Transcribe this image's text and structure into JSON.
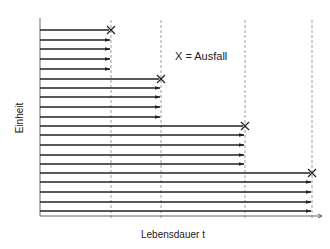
{
  "diagram": {
    "title": "",
    "legend": {
      "text": "X = Ausfall",
      "x": 175,
      "y": 60
    },
    "axes": {
      "x_label": "Lebensdauer t",
      "y_label": "Einheit",
      "origin": [
        40,
        216
      ],
      "x_end": 322,
      "y_top": 18
    },
    "colors": {
      "line": "#222222",
      "axis": "#666666",
      "dashed": "#888888",
      "text": "#222222"
    },
    "failure_times_px": [
      111,
      161,
      245,
      312
    ],
    "groups": [
      {
        "failure_x": 111,
        "rows": [
          {
            "y": 30,
            "failed": true
          },
          {
            "y": 40,
            "failed": false
          },
          {
            "y": 49,
            "failed": false
          },
          {
            "y": 59,
            "failed": false
          },
          {
            "y": 69,
            "failed": false
          }
        ]
      },
      {
        "failure_x": 161,
        "rows": [
          {
            "y": 79,
            "failed": true
          },
          {
            "y": 88,
            "failed": false
          },
          {
            "y": 97,
            "failed": false
          },
          {
            "y": 107,
            "failed": false
          },
          {
            "y": 117,
            "failed": false
          }
        ]
      },
      {
        "failure_x": 245,
        "rows": [
          {
            "y": 126,
            "failed": true
          },
          {
            "y": 135,
            "failed": false
          },
          {
            "y": 145,
            "failed": false
          },
          {
            "y": 155,
            "failed": false
          },
          {
            "y": 164,
            "failed": false
          }
        ]
      },
      {
        "failure_x": 312,
        "rows": [
          {
            "y": 173,
            "failed": true
          },
          {
            "y": 182,
            "failed": false
          },
          {
            "y": 192,
            "failed": false
          },
          {
            "y": 202,
            "failed": false
          },
          {
            "y": 211,
            "failed": false
          }
        ]
      }
    ]
  }
}
